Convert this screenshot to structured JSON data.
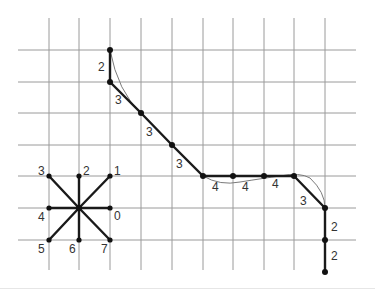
{
  "colors": {
    "grid": "#9a9a9a",
    "chain": "#1a1a1a",
    "curve": "#7a7a7a",
    "label": "#333333"
  },
  "grid": {
    "x_lines": [
      49,
      79,
      110,
      141,
      172,
      203,
      233,
      264,
      294,
      325
    ],
    "y_lines": [
      50,
      82,
      113,
      145,
      176,
      208,
      240
    ],
    "x_extent": [
      18,
      356
    ],
    "y_extent": [
      18,
      270
    ]
  },
  "direction_legend": {
    "center": [
      79,
      208
    ],
    "directions": [
      {
        "code": "0",
        "end": [
          110,
          208
        ],
        "label_pos": [
          114,
          220
        ]
      },
      {
        "code": "1",
        "end": [
          110,
          176
        ],
        "label_pos": [
          114,
          175
        ]
      },
      {
        "code": "2",
        "end": [
          79,
          176
        ],
        "label_pos": [
          83,
          175
        ]
      },
      {
        "code": "3",
        "end": [
          49,
          176
        ],
        "label_pos": [
          38,
          175
        ]
      },
      {
        "code": "4",
        "end": [
          49,
          208
        ],
        "label_pos": [
          38,
          221
        ]
      },
      {
        "code": "5",
        "end": [
          49,
          240
        ],
        "label_pos": [
          38,
          253
        ]
      },
      {
        "code": "6",
        "end": [
          79,
          240
        ],
        "label_pos": [
          69,
          253
        ]
      },
      {
        "code": "7",
        "end": [
          110,
          240
        ],
        "label_pos": [
          101,
          253
        ]
      }
    ]
  },
  "chain": {
    "nodes": [
      [
        110,
        50
      ],
      [
        110,
        82
      ],
      [
        141,
        113
      ],
      [
        172,
        145
      ],
      [
        203,
        176
      ],
      [
        233,
        176
      ],
      [
        264,
        176
      ],
      [
        294,
        176
      ],
      [
        325,
        208
      ],
      [
        325,
        240
      ],
      [
        325,
        272
      ]
    ],
    "codes": [
      "2",
      "3",
      "3",
      "3",
      "4",
      "4",
      "4",
      "3",
      "2",
      "2"
    ],
    "label_positions": [
      [
        98,
        71
      ],
      [
        115,
        104
      ],
      [
        146,
        136
      ],
      [
        176,
        168
      ],
      [
        212,
        191
      ],
      [
        242,
        191
      ],
      [
        272,
        188
      ],
      [
        300,
        205
      ],
      [
        331,
        231
      ],
      [
        331,
        260
      ]
    ],
    "code_sequence": "2 3 3 3 4 4 4 3 2 2"
  },
  "curve_path": "M110,50 Q118,92 141,113 L172,145 L203,176 Q220,186 240,182 Q265,178 280,176 Q300,172 310,178 Q325,192 325,208 L325,272"
}
